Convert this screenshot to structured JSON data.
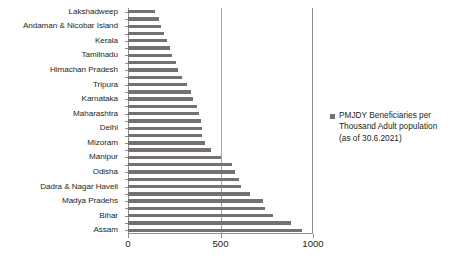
{
  "chart_data": {
    "type": "bar",
    "orientation": "horizontal",
    "title": "",
    "xlabel": "",
    "ylabel": "",
    "xlim": [
      0,
      1000
    ],
    "xticks": [
      0,
      500,
      1000
    ],
    "xtick_labels": [
      "0",
      "500",
      "1000"
    ],
    "grid": true,
    "gridlines": [
      500
    ],
    "legend_position": "right",
    "legend": [
      "PMJDY Beneficiaries per Thousand Adult population (as of 30.6.2021)"
    ],
    "series_color": "#767171",
    "categories": [
      "Lakshadweep",
      "",
      "Andaman & Nicobar Island",
      "",
      "Kerala",
      "",
      "Tamilnadu",
      "",
      "Himachan Pradesh",
      "",
      "Tripura",
      "",
      "Karnataka",
      "",
      "Maharashtra",
      "",
      "Delhi",
      "",
      "Mizoram",
      "",
      "Manipur",
      "",
      "Odisha",
      "",
      "Dadra & Nagar Haveli",
      "",
      "Madya Pradehs",
      "",
      "Bihar",
      "",
      "Assam"
    ],
    "values": [
      146,
      165,
      180,
      196,
      210,
      225,
      240,
      258,
      270,
      292,
      318,
      340,
      352,
      372,
      385,
      392,
      398,
      400,
      418,
      450,
      500,
      560,
      578,
      600,
      612,
      660,
      730,
      742,
      782,
      880,
      940
    ],
    "labeled_categories": [
      "Lakshadweep",
      "Andaman & Nicobar Island",
      "Kerala",
      "Tamilnadu",
      "Himachan Pradesh",
      "Tripura",
      "Karnataka",
      "Maharashtra",
      "Delhi",
      "Mizoram",
      "Manipur",
      "Odisha",
      "Dadra & Nagar Haveli",
      "Madya Pradehs",
      "Bihar",
      "Assam"
    ]
  },
  "legend": {
    "line1": "PMJDY Beneficiaries per",
    "line2": "Thousand Adult population",
    "line3": "(as of 30.6.2021)",
    "marker_color": "#767171"
  }
}
